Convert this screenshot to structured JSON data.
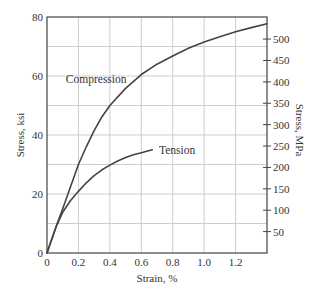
{
  "chart_data": {
    "type": "line",
    "title": "",
    "xlabel": "Strain, %",
    "ylabel": "Stress, ksi",
    "ylabel_right": "Stress, MPa",
    "xlim": [
      0,
      1.4
    ],
    "ylim": [
      0,
      80
    ],
    "ylim_right_mpa_per_ksi": 6.895,
    "grid": true,
    "x_ticks": [
      0,
      0.2,
      0.4,
      0.6,
      0.8,
      1.0,
      1.2
    ],
    "x_tick_labels": [
      "0",
      "0.2",
      "0.4",
      "0.6",
      "0.8",
      "1.0",
      "1.2"
    ],
    "y_ticks": [
      0,
      20,
      40,
      60,
      80
    ],
    "y_tick_labels": [
      "0",
      "20",
      "40",
      "60",
      "80"
    ],
    "y_grid": [
      10,
      20,
      30,
      40,
      50,
      60,
      70
    ],
    "y_right_ticks": [
      50,
      100,
      150,
      200,
      250,
      300,
      350,
      400,
      450,
      500
    ],
    "y_right_tick_labels": [
      "50",
      "100",
      "150",
      "200",
      "250",
      "300",
      "350",
      "400",
      "450",
      "500"
    ],
    "series": [
      {
        "name": "Compression",
        "x": [
          0,
          0.06,
          0.1,
          0.2,
          0.25,
          0.3,
          0.35,
          0.4,
          0.5,
          0.6,
          0.7,
          0.8,
          0.9,
          1.0,
          1.1,
          1.2,
          1.3,
          1.4
        ],
        "y": [
          0,
          9.2,
          15,
          30,
          36,
          41.5,
          46.2,
          50,
          55.8,
          60.5,
          64,
          66.8,
          69.4,
          71.5,
          73.3,
          75,
          76.4,
          77.7
        ]
      },
      {
        "name": "Tension",
        "x": [
          0,
          0.06,
          0.1,
          0.15,
          0.2,
          0.25,
          0.3,
          0.35,
          0.4,
          0.45,
          0.5,
          0.55,
          0.6,
          0.67
        ],
        "y": [
          0,
          9.2,
          13.8,
          17.8,
          20.9,
          23.8,
          26.2,
          28.2,
          29.8,
          31.2,
          32.4,
          33.3,
          34,
          35
        ]
      }
    ],
    "annotations": [
      {
        "text": "Compression",
        "series": "Compression",
        "x": 0.12,
        "y": 59
      },
      {
        "text": "Tension",
        "series": "Tension",
        "x": 0.7,
        "y": 35
      }
    ]
  }
}
